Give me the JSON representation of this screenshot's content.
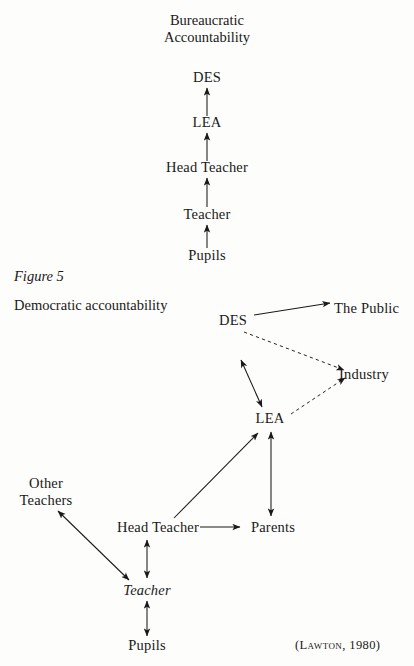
{
  "figure": {
    "heading": "Bureaucratic\nAccountability",
    "label": "Figure 5",
    "caption": "Democratic accountability",
    "citation": "(Lawton, 1980)"
  },
  "bureaucratic_chain": {
    "nodes": [
      {
        "id": "des",
        "label": "DES",
        "x": 207,
        "y": 77
      },
      {
        "id": "lea",
        "label": "LEA",
        "x": 207,
        "y": 122
      },
      {
        "id": "head_teacher",
        "label": "Head Teacher",
        "x": 207,
        "y": 167
      },
      {
        "id": "teacher",
        "label": "Teacher",
        "x": 207,
        "y": 214
      },
      {
        "id": "pupils",
        "label": "Pupils",
        "x": 207,
        "y": 255
      }
    ],
    "edges": [
      {
        "from": "lea",
        "to": "des",
        "style": "solid",
        "heads": "single"
      },
      {
        "from": "head_teacher",
        "to": "lea",
        "style": "solid",
        "heads": "single"
      },
      {
        "from": "teacher",
        "to": "head_teacher",
        "style": "solid",
        "heads": "single"
      },
      {
        "from": "pupils",
        "to": "teacher",
        "style": "solid",
        "heads": "single"
      }
    ]
  },
  "democratic_diagram": {
    "nodes": [
      {
        "id": "des",
        "label": "DES",
        "x": 233,
        "y": 320
      },
      {
        "id": "the_public",
        "label": "The Public",
        "x": 369,
        "y": 308
      },
      {
        "id": "industry",
        "label": "Industry",
        "x": 371,
        "y": 374
      },
      {
        "id": "lea",
        "label": "LEA",
        "x": 270,
        "y": 418
      },
      {
        "id": "other_teachers",
        "label": "Other\nTeachers",
        "x": 45,
        "y": 490
      },
      {
        "id": "head_teacher",
        "label": "Head Teacher",
        "x": 158,
        "y": 527
      },
      {
        "id": "parents",
        "label": "Parents",
        "x": 272,
        "y": 527
      },
      {
        "id": "teacher",
        "label": "Teacher",
        "x": 147,
        "y": 590,
        "italic": true
      },
      {
        "id": "pupils",
        "label": "Pupils",
        "x": 147,
        "y": 645
      }
    ],
    "edges": [
      {
        "from": "des",
        "to": "the_public",
        "style": "solid",
        "heads": "single"
      },
      {
        "from": "des",
        "to": "industry",
        "style": "dashed",
        "heads": "single"
      },
      {
        "from": "lea",
        "to": "industry",
        "style": "dashed",
        "heads": "single"
      },
      {
        "from": "des",
        "to": "lea",
        "style": "solid",
        "heads": "double"
      },
      {
        "from": "head_teacher",
        "to": "lea",
        "style": "solid",
        "heads": "single"
      },
      {
        "from": "lea",
        "to": "parents",
        "style": "solid",
        "heads": "double"
      },
      {
        "from": "head_teacher",
        "to": "parents",
        "style": "solid",
        "heads": "single"
      },
      {
        "from": "other_teachers",
        "to": "teacher",
        "style": "solid",
        "heads": "double"
      },
      {
        "from": "head_teacher",
        "to": "teacher",
        "style": "solid",
        "heads": "double"
      },
      {
        "from": "teacher",
        "to": "pupils",
        "style": "solid",
        "heads": "double"
      }
    ]
  },
  "colors": {
    "ink": "#191919",
    "page": "#fdfdfb"
  }
}
